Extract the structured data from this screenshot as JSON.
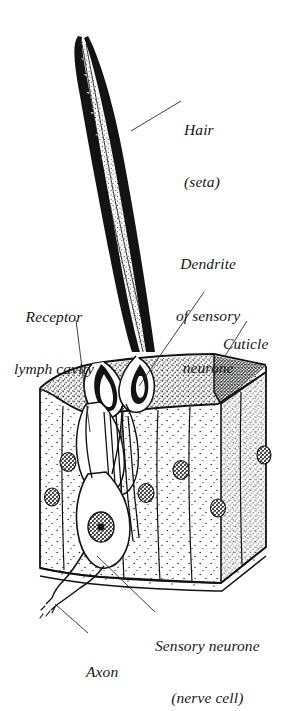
{
  "figure": {
    "style": "pen-and-ink biological line drawing, stippled shading",
    "background_color": "#ffffff",
    "ink_color": "#171717"
  },
  "labels": {
    "hair": {
      "line1": "Hair",
      "line2": "(seta)"
    },
    "dendrite": {
      "line1": "Dendrite",
      "line2": "of sensory",
      "line3": "neurone"
    },
    "receptor_lymph_cavity": {
      "line1": "Receptor",
      "line2": "lymph cavity"
    },
    "cuticle": {
      "line1": "Cuticle"
    },
    "sensory_neurone": {
      "line1": "Sensory neurone",
      "line2": "(nerve cell)"
    },
    "axon": {
      "line1": "Axon"
    }
  },
  "structures": [
    {
      "name": "hair-shaft",
      "label": "Hair (seta)"
    },
    {
      "name": "hair-socket",
      "label": "socket / membrane"
    },
    {
      "name": "cuticle-slab",
      "label": "Cuticle"
    },
    {
      "name": "epidermis-block",
      "label": "epidermal cells"
    },
    {
      "name": "receptor-lymph-cavity",
      "label": "Receptor lymph cavity"
    },
    {
      "name": "dendrite",
      "label": "Dendrite of sensory neurone"
    },
    {
      "name": "sensory-neurone-cell-body",
      "label": "Sensory neurone (nerve cell)"
    },
    {
      "name": "axon",
      "label": "Axon"
    },
    {
      "name": "basement-membrane",
      "label": "basement membrane"
    }
  ]
}
